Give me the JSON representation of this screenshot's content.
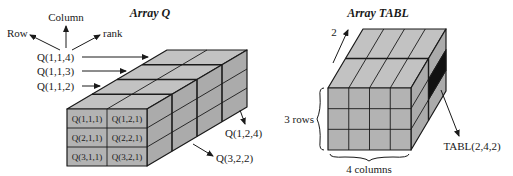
{
  "array_q": {
    "title": "Array Q",
    "axes": {
      "row": "Row",
      "column": "Column",
      "rank": "rank"
    },
    "layer_labels": [
      "Q(1,1,4)",
      "Q(1,1,3)",
      "Q(1,1,2)"
    ],
    "front_cells": [
      [
        "Q(1,1,1)",
        "Q(1,2,1)"
      ],
      [
        "Q(2,1,1)",
        "Q(2,2,1)"
      ],
      [
        "Q(3,1,1)",
        "Q(3,2,1)"
      ]
    ],
    "callouts": [
      "Q(1,2,4)",
      "Q(3,2,2)"
    ],
    "rows": 3,
    "columns": 2,
    "ranks": 4
  },
  "array_tabl": {
    "title": "Array TABL",
    "depth_label": "2",
    "rows_label": "3 rows",
    "columns_label": "4 columns",
    "callout": "TABL(2,4,2)",
    "rows": 3,
    "columns": 4,
    "ranks": 2
  },
  "colors": {
    "face": "#b5b5b5",
    "top": "#c0c0c0",
    "side": "#a8a8a8",
    "line": "#1a1a1a",
    "highlight": "#111111"
  }
}
